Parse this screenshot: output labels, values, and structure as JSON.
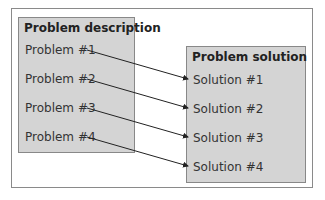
{
  "diagram": {
    "left_box": {
      "title": "Problem description",
      "items": [
        "Problem #1",
        "Problem #2",
        "Problem #3",
        "Problem #4"
      ]
    },
    "right_box": {
      "title": "Problem solution",
      "items": [
        "Solution #1",
        "Solution #2",
        "Solution #3",
        "Solution #4"
      ]
    },
    "connections": [
      {
        "from": "Problem #1",
        "to": "Solution #1"
      },
      {
        "from": "Problem #2",
        "to": "Solution #2"
      },
      {
        "from": "Problem #3",
        "to": "Solution #3"
      },
      {
        "from": "Problem #4",
        "to": "Solution #4"
      }
    ],
    "colors": {
      "box_fill": "#d4d4d4",
      "border": "#888888",
      "arrow": "#222222"
    }
  }
}
